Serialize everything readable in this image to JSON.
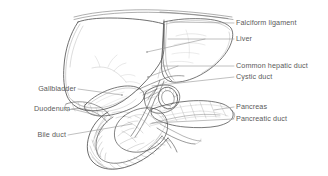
{
  "figure": {
    "type": "anatomical-line-illustration",
    "background_color": "#ffffff",
    "ink_color": "#4a4a4a",
    "label_color": "#5a5a5a",
    "leader_color": "#8a8a8a",
    "width": 328,
    "height": 176
  },
  "labels": {
    "falciform_ligament": "Falciform ligament",
    "liver": "Liver",
    "common_hepatic_duct": "Common hepatic duct",
    "cystic_duct": "Cystic duct",
    "pancreas": "Pancreas",
    "pancreatic_duct": "Pancreatic duct",
    "gallbladder": "Gallbladder",
    "duodenum": "Duodenum",
    "bile_duct": "Bile duct"
  },
  "structures": [
    {
      "name": "liver",
      "label": "Liver",
      "side": "right",
      "label_x": 236,
      "label_y": 36
    },
    {
      "name": "falciform-ligament",
      "label": "Falciform ligament",
      "side": "right",
      "label_x": 236,
      "label_y": 20
    },
    {
      "name": "common-hepatic-duct",
      "label": "Common hepatic duct",
      "side": "right",
      "label_x": 236,
      "label_y": 63
    },
    {
      "name": "cystic-duct",
      "label": "Cystic duct",
      "side": "right",
      "label_x": 236,
      "label_y": 74
    },
    {
      "name": "pancreas",
      "label": "Pancreas",
      "side": "right",
      "label_x": 236,
      "label_y": 104
    },
    {
      "name": "pancreatic-duct",
      "label": "Pancreatic duct",
      "side": "right",
      "label_x": 236,
      "label_y": 116
    },
    {
      "name": "gallbladder",
      "label": "Gallbladder",
      "side": "left",
      "label_x": 16,
      "label_y": 86
    },
    {
      "name": "duodenum",
      "label": "Duodenum",
      "side": "left",
      "label_x": 28,
      "label_y": 106
    },
    {
      "name": "bile-duct",
      "label": "Bile duct",
      "side": "left",
      "label_x": 32,
      "label_y": 132
    }
  ]
}
